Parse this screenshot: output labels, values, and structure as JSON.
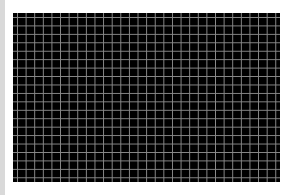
{
  "canvas": {
    "description": "black grid",
    "columns": 31,
    "rows": 20,
    "background_color": "#000000",
    "line_color": "#8a8a8a"
  },
  "left_bar": {
    "color": "#d9d9d9"
  }
}
